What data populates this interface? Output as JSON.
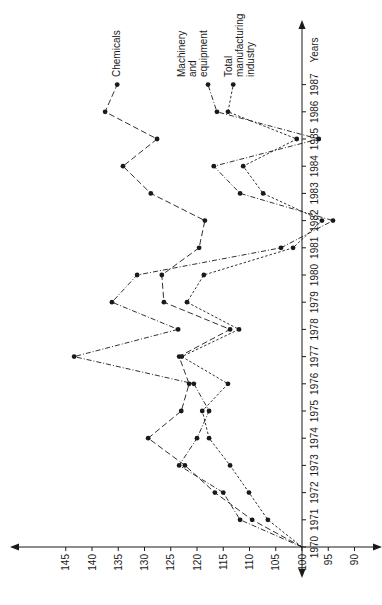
{
  "chart_data": {
    "type": "line",
    "orientation": "rotated-90-ccw",
    "title": "",
    "xlabel": "Years",
    "ylabel": "",
    "x": [
      1970,
      1971,
      1972,
      1973,
      1974,
      1975,
      1976,
      1977,
      1978,
      1979,
      1980,
      1981,
      1982,
      1983,
      1984,
      1985,
      1986,
      1987
    ],
    "x_tick_labels": [
      "1970",
      "1971",
      "1972",
      "1973",
      "1974",
      "1975",
      "1976",
      "1977",
      "1978",
      "1979",
      "1980",
      "1981",
      "1982",
      "1983",
      "1984",
      "1985",
      "1986",
      "1987"
    ],
    "y_ticks": [
      145,
      140,
      135,
      130,
      125,
      120,
      115,
      110,
      105,
      100,
      95,
      90
    ],
    "y_tick_labels": [
      "145",
      "140",
      "135",
      "130",
      "125",
      "120",
      "115",
      "110",
      "105",
      "100",
      "95",
      "90"
    ],
    "ylim": [
      88,
      150
    ],
    "grid": false,
    "legend_position": "inline-end-labels",
    "series": [
      {
        "name": "Chemicals",
        "label_lines": [
          "Chemicals"
        ],
        "line_style": "long-dash",
        "values": [
          100,
          109.5,
          116.6,
          122.3,
          129.3,
          123.0,
          121.5,
          123.4,
          113.7,
          126.3,
          126.7,
          119.6,
          118.5,
          128.8,
          134.1,
          127.6,
          137.5,
          135.2
        ]
      },
      {
        "name": "Machinery and equipment",
        "label_lines": [
          "Machinery",
          "and",
          "equipment"
        ],
        "line_style": "dash-dot",
        "values": [
          100,
          111.8,
          115.0,
          123.4,
          120.0,
          117.7,
          120.6,
          143.4,
          123.6,
          136.2,
          131.4,
          104.0,
          94.1,
          111.8,
          116.8,
          96.8,
          116.2,
          117.9
        ]
      },
      {
        "name": "Total manufacturing industry",
        "label_lines": [
          "Total",
          "manufacturing",
          "industry"
        ],
        "line_style": "short-dash",
        "values": [
          100,
          106.5,
          110.1,
          113.7,
          117.7,
          119.0,
          114.1,
          122.9,
          112.0,
          121.9,
          118.7,
          101.7,
          96.2,
          107.4,
          111.2,
          101.0,
          114.1,
          113.1
        ]
      }
    ]
  },
  "colors": {
    "ink": "#1a1a1a",
    "background": "#ffffff"
  }
}
